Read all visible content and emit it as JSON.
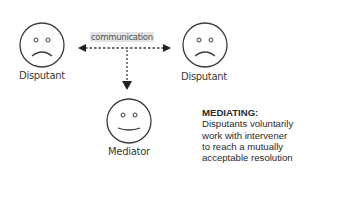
{
  "diagram": {
    "nodes": [
      {
        "id": "disputant-left",
        "label": "Disputant",
        "expression": "sad"
      },
      {
        "id": "disputant-right",
        "label": "Disputant",
        "expression": "sad"
      },
      {
        "id": "mediator",
        "label": "Mediator",
        "expression": "neutral-smile"
      }
    ],
    "edges": [
      {
        "from": "disputant-left",
        "to": "disputant-right",
        "label": "communication",
        "style": "dashed",
        "direction": "both"
      },
      {
        "from": "communication-line",
        "to": "mediator",
        "style": "dashed",
        "direction": "down"
      }
    ],
    "description": {
      "title": "MEDIATING:",
      "lines": [
        "Disputants voluntarily",
        "work with intervener",
        "to reach a mutually",
        "acceptable resolution"
      ]
    },
    "colors": {
      "stroke": "#3c3c3c",
      "label_bg": "#e4e4e4"
    }
  }
}
